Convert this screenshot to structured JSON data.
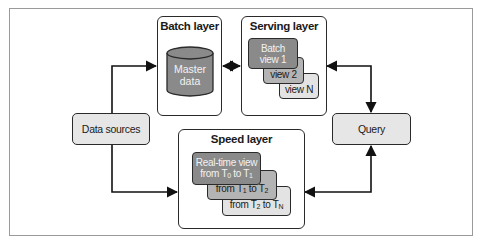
{
  "diagram": {
    "type": "lambda-architecture",
    "nodes": {
      "data_sources": "Data sources",
      "query": "Query",
      "batch_layer": {
        "title": "Batch layer",
        "storage": {
          "line1": "Master",
          "line2": "data"
        }
      },
      "serving_layer": {
        "title": "Serving layer",
        "views": [
          {
            "line1": "Batch",
            "line2": "view 1"
          },
          {
            "line1": "view 2"
          },
          {
            "line1": "view N"
          }
        ]
      },
      "speed_layer": {
        "title": "Speed layer",
        "views": [
          {
            "line1": "Real-time view",
            "line2_prefix": "from T",
            "sub_a": "0",
            "mid": " to T",
            "sub_b": "1"
          },
          {
            "prefix": "from T",
            "sub_a": "1",
            "mid": " to T",
            "sub_b": "2"
          },
          {
            "prefix": "from T",
            "sub_a": "2",
            "mid": " to T",
            "sub_b": "N"
          }
        ]
      }
    },
    "edges": [
      {
        "from": "Data sources",
        "to": "Batch layer",
        "type": "arrow"
      },
      {
        "from": "Data sources",
        "to": "Speed layer",
        "type": "arrow"
      },
      {
        "from": "Batch layer",
        "to": "Serving layer",
        "type": "bidirectional"
      },
      {
        "from": "Serving layer",
        "to": "Query",
        "type": "bidirectional"
      },
      {
        "from": "Speed layer",
        "to": "Query",
        "type": "bidirectional"
      }
    ],
    "colors": {
      "dark_fill": "#8a8a8a",
      "mid_fill": "#b4b4b4",
      "light_fill": "#e3e3e3",
      "stroke": "#2a2a2a"
    }
  }
}
